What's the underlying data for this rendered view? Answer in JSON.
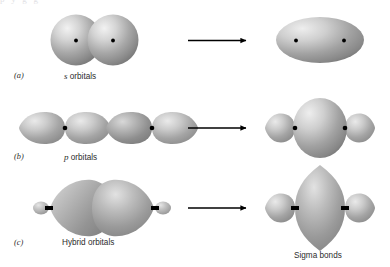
{
  "figure": {
    "title_cutoff_fragment": "p      y              g                 g",
    "background_color": "#ffffff",
    "orbital_light": "#efefef",
    "orbital_mid": "#9b9b9b",
    "orbital_dark": "#6e6e6e",
    "nucleus_color": "#000000",
    "arrow_color": "#000000"
  },
  "rows": [
    {
      "tag": "(a)",
      "caption_prefix": "s",
      "caption_rest": " orbitals",
      "caption_full": "s orbitals",
      "left_shape": "two-overlapping-spheres",
      "right_shape": "merged-ellipse",
      "arrow": "right-arrow"
    },
    {
      "tag": "(b)",
      "caption_prefix": "p",
      "caption_rest": " orbitals",
      "caption_full": "p orbitals",
      "left_shape": "four-p-lobes-inline",
      "right_shape": "large-ellipse-with-small-lobes",
      "arrow": "right-arrow"
    },
    {
      "tag": "(c)",
      "caption_prefix": "",
      "caption_rest": "Hybrid orbitals",
      "caption_full": "Hybrid orbitals",
      "left_shape": "two-hybrid-teardrops",
      "right_shape": "tall-lens-with-small-lobes",
      "arrow": "right-arrow"
    }
  ],
  "result_label": "Sigma bonds"
}
